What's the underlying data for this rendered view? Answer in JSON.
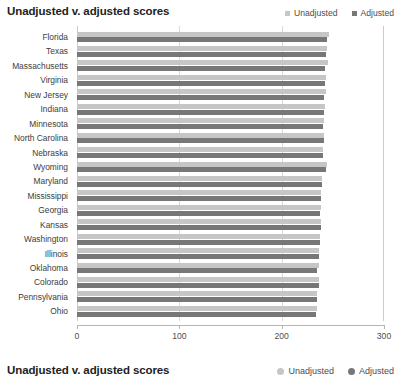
{
  "header": {
    "title": "Unadjusted v. adjusted scores"
  },
  "footer": {
    "title": "Unadjusted v. adjusted scores"
  },
  "legend": {
    "unadjusted_label": "Unadjusted",
    "adjusted_label": "Adjusted",
    "unadjusted_color": "#c6c6c6",
    "adjusted_color": "#777777",
    "unadjusted_marker_top": "square-marker",
    "adjusted_marker_top": "square-marker",
    "unadjusted_marker_bottom": "circle-marker",
    "adjusted_marker_bottom": "circle-marker"
  },
  "chart_data": {
    "type": "bar",
    "orientation": "horizontal",
    "title": "Unadjusted v. adjusted scores",
    "xlabel": "",
    "ylabel": "",
    "xlim": [
      0,
      300
    ],
    "xticks": [
      0,
      100,
      200,
      300
    ],
    "xticklabels": [
      "0",
      "100",
      "200",
      "300"
    ],
    "grid": true,
    "grid_axis": "x",
    "legend_position": "top-right",
    "categories": [
      "Florida",
      "Texas",
      "Massachusetts",
      "Virginia",
      "New Jersey",
      "Indiana",
      "Minnesota",
      "North Carolina",
      "Nebraska",
      "Wyoming",
      "Maryland",
      "Mississippi",
      "Georgia",
      "Kansas",
      "Washington",
      "Illinois",
      "Oklahoma",
      "Colorado",
      "Pennsylvania",
      "Ohio"
    ],
    "series": [
      {
        "name": "Unadjusted",
        "color": "#c6c6c6",
        "values": [
          246,
          244,
          245,
          243,
          243,
          242,
          241,
          241,
          240,
          244,
          239,
          238,
          238,
          238,
          237,
          236,
          236,
          236,
          235,
          235
        ]
      },
      {
        "name": "Adjusted",
        "color": "#777777",
        "values": [
          244,
          243,
          242,
          242,
          241,
          241,
          240,
          241,
          240,
          243,
          239,
          238,
          237,
          238,
          237,
          236,
          235,
          236,
          235,
          234
        ]
      }
    ]
  }
}
